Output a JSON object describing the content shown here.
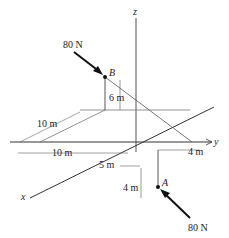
{
  "diagram": {
    "axes": {
      "x": "x",
      "y": "y",
      "z": "z"
    },
    "points": {
      "A": "A",
      "B": "B"
    },
    "forces": {
      "at_B": "80 N",
      "at_A": "80 N"
    },
    "dimensions": {
      "B_height": "6 m",
      "B_x_offset": "10 m",
      "B_y_offset": "10 m",
      "A_x_offset": "5 m",
      "A_y_offset": "4 m",
      "A_depth": "4 m"
    },
    "colors": {
      "line": "#333333",
      "arrow": "#111111"
    }
  }
}
